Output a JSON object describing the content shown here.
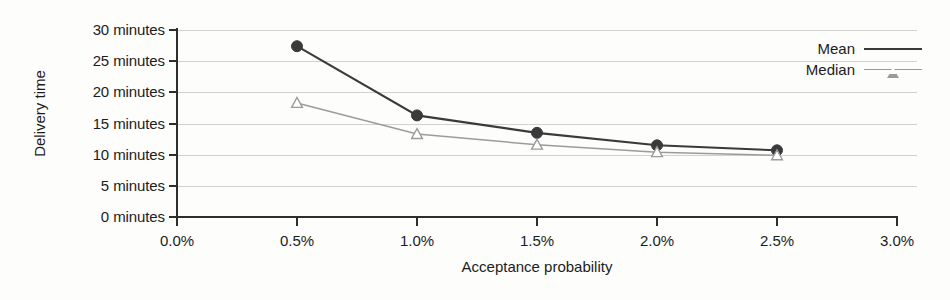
{
  "chart_data": {
    "type": "line",
    "title": "",
    "xlabel": "Acceptance probability",
    "ylabel": "Delivery time",
    "x": [
      0.5,
      1.0,
      1.5,
      2.0,
      2.5
    ],
    "xlim": [
      0.0,
      3.0
    ],
    "ylim": [
      0,
      30
    ],
    "grid": true,
    "legend_position": "top-right",
    "x_tick_labels": [
      "0.0%",
      "0.5%",
      "1.0%",
      "1.5%",
      "2.0%",
      "2.5%",
      "3.0%"
    ],
    "x_tick_values": [
      0.0,
      0.5,
      1.0,
      1.5,
      2.0,
      2.5,
      3.0
    ],
    "y_tick_labels": [
      "30 minutes",
      "25 minutes",
      "20 minutes",
      "15 minutes",
      "10 minutes",
      "5 minutes",
      "0 minutes"
    ],
    "y_tick_values": [
      30,
      25,
      20,
      15,
      10,
      5,
      0
    ],
    "series": [
      {
        "name": "Mean",
        "values": [
          27.4,
          16.3,
          13.5,
          11.5,
          10.7
        ],
        "color": "#3a3a3a",
        "marker": "circle"
      },
      {
        "name": "Median",
        "values": [
          18.3,
          13.3,
          11.6,
          10.4,
          9.9
        ],
        "color": "#9b9b9b",
        "marker": "triangle"
      }
    ]
  },
  "legend": {
    "items": [
      {
        "label": "Mean",
        "color": "#3a3a3a",
        "marker": "circle"
      },
      {
        "label": "Median",
        "color": "#9b9b9b",
        "marker": "triangle"
      }
    ]
  },
  "axes": {
    "y_title": "Delivery time",
    "x_title": "Acceptance probability"
  }
}
